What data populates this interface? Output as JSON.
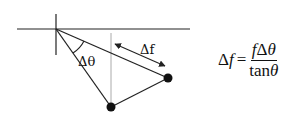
{
  "diagram": {
    "labels": {
      "delta_theta": "Δθ",
      "delta_f": "Δf"
    },
    "colors": {
      "line": "#222222",
      "guide_line": "#aaaaaa",
      "dot": "#111111"
    }
  },
  "formula": {
    "lhs_delta": "Δ",
    "lhs_var": "f",
    "equals": "=",
    "numerator_f": "f",
    "numerator_delta": "Δ",
    "numerator_theta": "θ",
    "denominator_func": "tan",
    "denominator_theta": "θ"
  }
}
